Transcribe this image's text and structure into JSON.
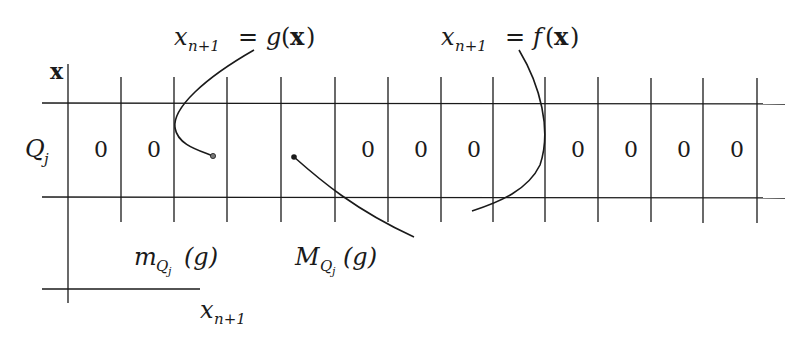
{
  "figure": {
    "labels": {
      "g_map": {
        "lhs_var": "x",
        "lhs_sub": "n+1",
        "eq": "=",
        "rhs_fn": "g",
        "rhs_open": "(",
        "rhs_arg": "x",
        "rhs_close": ")"
      },
      "f_map": {
        "lhs_var": "x",
        "lhs_sub": "n+1",
        "eq": "=",
        "rhs_fn": "f",
        "rhs_open": "(",
        "rhs_arg": "x",
        "rhs_close": ")"
      },
      "x_axis_label": "x",
      "row_label": {
        "var": "Q",
        "sub": "j"
      },
      "m_label": {
        "var": "m",
        "sub_var": "Q",
        "sub_sub": "j",
        "arg": "(g)"
      },
      "M_label": {
        "var": "M",
        "sub_var": "Q",
        "sub_sub": "j",
        "arg": "(g)"
      },
      "x_next_label": {
        "var": "x",
        "sub": "n+1"
      }
    },
    "cells": [
      {
        "col": 1,
        "value": "0"
      },
      {
        "col": 2,
        "value": "0"
      },
      {
        "col": 7,
        "value": "0"
      },
      {
        "col": 8,
        "value": "0"
      },
      {
        "col": 9,
        "value": "0"
      },
      {
        "col": 11,
        "value": "0"
      },
      {
        "col": 12,
        "value": "0"
      },
      {
        "col": 13,
        "value": "0"
      },
      {
        "col": 14,
        "value": "0"
      }
    ],
    "colors": {
      "ink": "#1a1a1a",
      "background": "#ffffff"
    }
  }
}
